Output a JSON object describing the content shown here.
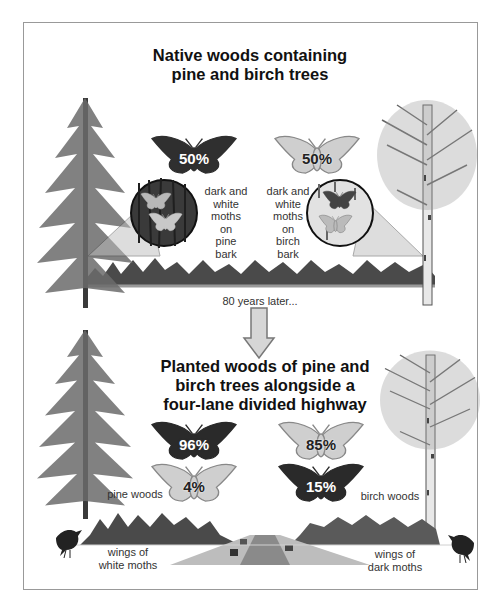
{
  "top_section": {
    "title_line1": "Native woods containing",
    "title_line2": "pine and birch trees",
    "dark_moth": {
      "percent": "50%",
      "color": "dark"
    },
    "light_moth": {
      "percent": "50%",
      "color": "light"
    },
    "pine_caption": [
      "dark and",
      "white",
      "moths",
      "on",
      "pine",
      "bark"
    ],
    "birch_caption": [
      "dark and",
      "white",
      "moths",
      "on",
      "birch",
      "bark"
    ]
  },
  "transition": {
    "label": "80 years later...",
    "arrow": "down-arrow-icon"
  },
  "bottom_section": {
    "title_line1": "Planted woods of pine and",
    "title_line2": "birch trees alongside a",
    "title_line3": "four-lane divided highway",
    "pine_woods": {
      "label": "pine woods",
      "dark_moth_percent": "96%",
      "light_moth_percent": "4%",
      "bird_label_line1": "wings of",
      "bird_label_line2": "white moths"
    },
    "birch_woods": {
      "label": "birch woods",
      "light_moth_percent": "85%",
      "dark_moth_percent": "15%",
      "bird_label_line1": "wings of",
      "bird_label_line2": "dark moths"
    }
  },
  "colors": {
    "dark_moth": "#2a2a2a",
    "light_moth": "#c8c8c8",
    "frame_border": "#999999",
    "arrow_fill": "#d6d6d6"
  }
}
